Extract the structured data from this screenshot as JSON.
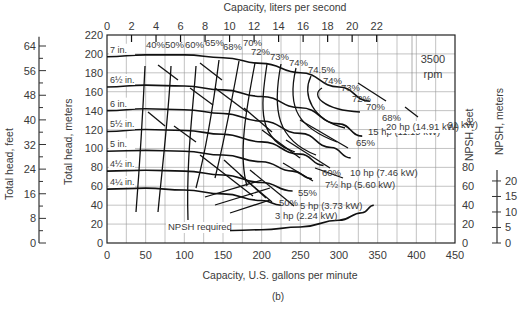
{
  "chart_data": {
    "type": "line",
    "caption": "(b)",
    "speed_label": [
      "3500",
      "rpm"
    ],
    "xlabel_bottom": "Capacity, U.S. gallons per minute",
    "xlabel_top": "Capacity, liters per second",
    "ylabel_left_feet": "Total head, feet",
    "ylabel_left_meters": "Total head, meters",
    "ylabel_right_npsh_feet": "NPSH, feet",
    "ylabel_right_npsh_meters": "NPSH, meters",
    "x_gpm_ticks": [
      0,
      50,
      100,
      150,
      200,
      250,
      300,
      350,
      400,
      450
    ],
    "x_lps_ticks": [
      0,
      2,
      4,
      6,
      8,
      10,
      12,
      14,
      16,
      18,
      20,
      22
    ],
    "y_head_ft_ticks": [
      0,
      20,
      40,
      60,
      80,
      100,
      120,
      140,
      160,
      180,
      200,
      220
    ],
    "y_head_m_ticks": [
      0,
      8,
      16,
      24,
      32,
      40,
      48,
      56,
      64
    ],
    "y_npsh_ft_ticks": [
      0,
      20,
      40,
      60,
      80
    ],
    "y_npsh_m_ticks": [
      0,
      5,
      10,
      15,
      20
    ],
    "xlim": [
      0,
      450
    ],
    "ylim": [
      0,
      220
    ],
    "grid": true,
    "impeller_curves": [
      {
        "name": "7 in.",
        "label": "7 in.",
        "x": [
          0,
          50,
          100,
          150,
          200,
          250,
          300,
          340
        ],
        "y": [
          197,
          199,
          199,
          196,
          190,
          180,
          165,
          150
        ]
      },
      {
        "name": "6 1/2 in.",
        "label": "6½ in.",
        "x": [
          0,
          50,
          100,
          150,
          200,
          250,
          300,
          330
        ],
        "y": [
          165,
          167,
          166,
          162,
          155,
          143,
          126,
          113
        ]
      },
      {
        "name": "6 in.",
        "label": "6 in.",
        "x": [
          0,
          50,
          100,
          150,
          200,
          250,
          290,
          315
        ],
        "y": [
          140,
          142,
          141,
          137,
          129,
          116,
          101,
          90
        ]
      },
      {
        "name": "5 1/2 in.",
        "label": "5½ in.",
        "x": [
          0,
          50,
          100,
          150,
          200,
          250,
          280
        ],
        "y": [
          118,
          120,
          119,
          115,
          107,
          94,
          82
        ]
      },
      {
        "name": "5 in.",
        "label": "5 in.",
        "x": [
          0,
          50,
          100,
          150,
          200,
          240,
          265
        ],
        "y": [
          97,
          98,
          97,
          93,
          86,
          76,
          68
        ]
      },
      {
        "name": "4 1/2 in.",
        "label": "4½ in.",
        "x": [
          0,
          50,
          100,
          150,
          200,
          240
        ],
        "y": [
          76,
          77,
          76,
          72,
          64,
          55
        ]
      },
      {
        "name": "4 1/4 in.",
        "label": "4¼ in.",
        "x": [
          0,
          50,
          100,
          150,
          200,
          225
        ],
        "y": [
          57,
          58,
          56,
          52,
          45,
          40
        ]
      }
    ],
    "efficiency_labels": [
      "40%",
      "50%",
      "60%",
      "65%",
      "68%",
      "70%",
      "72%",
      "73%",
      "74%",
      "74.5%",
      "74%",
      "73%",
      "72%",
      "70%",
      "68%",
      "65%",
      "60%",
      "55%",
      "50%"
    ],
    "power_lines": [
      {
        "label": "20 hp (14.91 kW)"
      },
      {
        "label": "15 hp (11.19 kW)"
      },
      {
        "label": "10 hp (7.46 kW)"
      },
      {
        "label": "7½ hp (5.60 kW)"
      },
      {
        "label": "5 hp (3.73 kW)"
      },
      {
        "label": "3 hp (2.24 kW)"
      }
    ],
    "npsh_required": {
      "label": "NPSH required",
      "x": [
        80,
        150,
        200,
        250,
        300,
        330,
        345
      ],
      "y": [
        13,
        13,
        14,
        17,
        24,
        32,
        40
      ]
    }
  }
}
